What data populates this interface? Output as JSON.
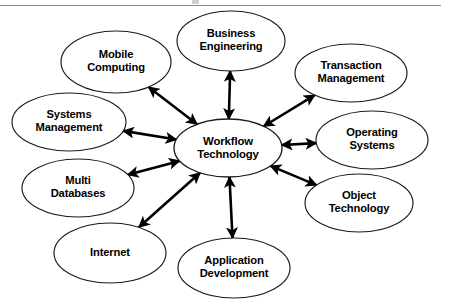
{
  "figure": {
    "name": "workflow-technology-relationship-diagram",
    "width": 449,
    "height": 299,
    "background_color": "#ffffff",
    "line_color": "#000000",
    "node_stroke_color": "#1a1a1a",
    "top_rule_color": "#8a8a8a"
  },
  "center": {
    "id": "workflow-technology",
    "label_line1": "Workflow",
    "label_line2": "Technology",
    "cx": 228,
    "cy": 148,
    "rx": 54,
    "ry": 29
  },
  "nodes": [
    {
      "id": "mobile-computing",
      "label_line1": "Mobile",
      "label_line2": "Computing",
      "cx": 116,
      "cy": 62,
      "rx": 55,
      "ry": 31
    },
    {
      "id": "business-engineering",
      "label_line1": "Business",
      "label_line2": "Engineering",
      "cx": 231,
      "cy": 41,
      "rx": 54,
      "ry": 30
    },
    {
      "id": "transaction-management",
      "label_line1": "Transaction",
      "label_line2": "Management",
      "cx": 351,
      "cy": 73,
      "rx": 56,
      "ry": 29
    },
    {
      "id": "operating-systems",
      "label_line1": "Operating",
      "label_line2": "Systems",
      "cx": 372,
      "cy": 140,
      "rx": 56,
      "ry": 29
    },
    {
      "id": "object-technology",
      "label_line1": "Object",
      "label_line2": "Technology",
      "cx": 359,
      "cy": 203,
      "rx": 54,
      "ry": 29
    },
    {
      "id": "application-development",
      "label_line1": "Application",
      "label_line2": "Development",
      "cx": 234,
      "cy": 268,
      "rx": 56,
      "ry": 30
    },
    {
      "id": "internet",
      "label_line1": "Internet",
      "label_line2": "",
      "cx": 110,
      "cy": 253,
      "rx": 56,
      "ry": 30
    },
    {
      "id": "multi-databases",
      "label_line1": "Multi",
      "label_line2": "Databases",
      "cx": 78,
      "cy": 188,
      "rx": 56,
      "ry": 29
    },
    {
      "id": "systems-management",
      "label_line1": "Systems",
      "label_line2": "Management",
      "cx": 69,
      "cy": 122,
      "rx": 57,
      "ry": 29
    }
  ],
  "connectors": [
    {
      "id": "connector-mobile-computing",
      "from": "workflow-technology",
      "to": "mobile-computing",
      "arrowheads": "both"
    },
    {
      "id": "connector-business-engineering",
      "from": "workflow-technology",
      "to": "business-engineering",
      "arrowheads": "both"
    },
    {
      "id": "connector-transaction-management",
      "from": "workflow-technology",
      "to": "transaction-management",
      "arrowheads": "both"
    },
    {
      "id": "connector-operating-systems",
      "from": "workflow-technology",
      "to": "operating-systems",
      "arrowheads": "both"
    },
    {
      "id": "connector-object-technology",
      "from": "workflow-technology",
      "to": "object-technology",
      "arrowheads": "both"
    },
    {
      "id": "connector-application-development",
      "from": "workflow-technology",
      "to": "application-development",
      "arrowheads": "both"
    },
    {
      "id": "connector-internet",
      "from": "workflow-technology",
      "to": "internet",
      "arrowheads": "both"
    },
    {
      "id": "connector-multi-databases",
      "from": "workflow-technology",
      "to": "multi-databases",
      "arrowheads": "both"
    },
    {
      "id": "connector-systems-management",
      "from": "workflow-technology",
      "to": "systems-management",
      "arrowheads": "both"
    }
  ]
}
